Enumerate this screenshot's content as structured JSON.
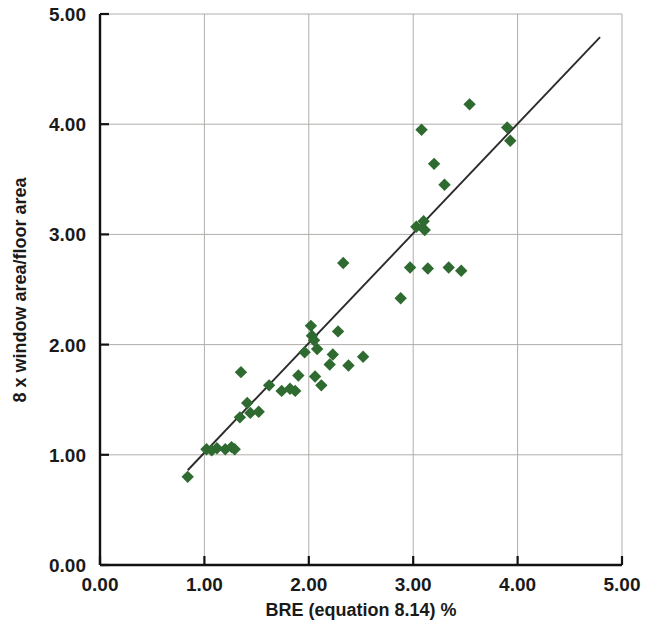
{
  "chart_data": {
    "type": "scatter",
    "title": "",
    "xlabel": "BRE (equation 8.14) %",
    "ylabel": "8 x window area/floor area",
    "xlim": [
      0,
      5
    ],
    "ylim": [
      0,
      5
    ],
    "xticks": [
      "0.00",
      "1.00",
      "2.00",
      "3.00",
      "4.00",
      "5.00"
    ],
    "yticks": [
      "0.00",
      "1.00",
      "2.00",
      "3.00",
      "4.00",
      "5.00"
    ],
    "xtick_values": [
      0,
      1,
      2,
      3,
      4,
      5
    ],
    "ytick_values": [
      0,
      1,
      2,
      3,
      4,
      5
    ],
    "grid": true,
    "legend": "none",
    "marker_shape": "diamond",
    "marker_color": "#2f6b30",
    "series": [
      {
        "name": "observations",
        "points": [
          [
            0.84,
            0.8
          ],
          [
            1.02,
            1.05
          ],
          [
            1.07,
            1.04
          ],
          [
            1.12,
            1.06
          ],
          [
            1.2,
            1.05
          ],
          [
            1.26,
            1.07
          ],
          [
            1.29,
            1.05
          ],
          [
            1.34,
            1.34
          ],
          [
            1.35,
            1.75
          ],
          [
            1.41,
            1.47
          ],
          [
            1.44,
            1.38
          ],
          [
            1.52,
            1.39
          ],
          [
            1.62,
            1.63
          ],
          [
            1.74,
            1.58
          ],
          [
            1.82,
            1.6
          ],
          [
            1.87,
            1.58
          ],
          [
            1.9,
            1.72
          ],
          [
            1.96,
            1.93
          ],
          [
            2.02,
            2.17
          ],
          [
            2.03,
            2.08
          ],
          [
            2.05,
            2.04
          ],
          [
            2.06,
            1.71
          ],
          [
            2.08,
            1.96
          ],
          [
            2.12,
            1.63
          ],
          [
            2.2,
            1.82
          ],
          [
            2.23,
            1.91
          ],
          [
            2.28,
            2.12
          ],
          [
            2.33,
            2.74
          ],
          [
            2.38,
            1.81
          ],
          [
            2.52,
            1.89
          ],
          [
            2.88,
            2.42
          ],
          [
            2.97,
            2.7
          ],
          [
            3.03,
            3.07
          ],
          [
            3.08,
            3.95
          ],
          [
            3.1,
            3.12
          ],
          [
            3.11,
            3.04
          ],
          [
            3.14,
            2.69
          ],
          [
            3.2,
            3.64
          ],
          [
            3.3,
            3.45
          ],
          [
            3.34,
            2.7
          ],
          [
            3.46,
            2.67
          ],
          [
            3.54,
            4.18
          ],
          [
            3.9,
            3.97
          ],
          [
            3.93,
            3.85
          ]
        ]
      }
    ],
    "trendline": {
      "name": "linear fit",
      "x1": 0.84,
      "y1": 0.86,
      "x2": 4.79,
      "y2": 4.79,
      "color": "#2b2b2b"
    }
  }
}
